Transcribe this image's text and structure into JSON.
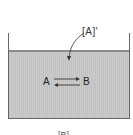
{
  "diagram": {
    "type": "equilibrium-container",
    "surface_label": "[A]'",
    "species_left": "A",
    "species_right": "B",
    "bottom_label": "[B]",
    "colors": {
      "liquid": "#c9c9c9",
      "walls": "#666666",
      "text": "#222222"
    }
  }
}
